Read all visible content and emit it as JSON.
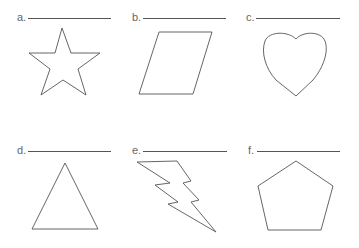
{
  "worksheet": {
    "items": [
      {
        "label": "a.",
        "shape": "star"
      },
      {
        "label": "b.",
        "shape": "parallelogram"
      },
      {
        "label": "c.",
        "shape": "heart"
      },
      {
        "label": "d.",
        "shape": "triangle"
      },
      {
        "label": "e.",
        "shape": "lightning-bolt"
      },
      {
        "label": "f.",
        "shape": "pentagon"
      }
    ],
    "stroke_color": "#555555"
  }
}
